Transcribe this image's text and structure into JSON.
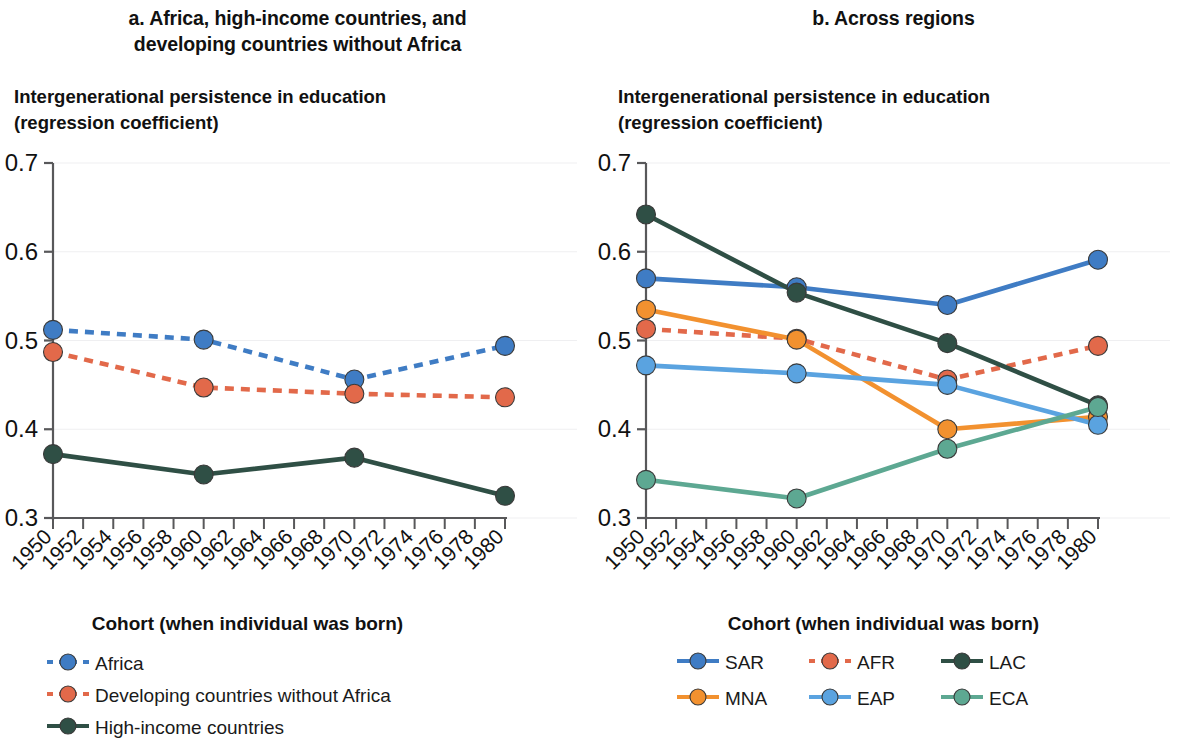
{
  "figure": {
    "panels": [
      {
        "id": "a",
        "title": "a. Africa, high-income countries, and developing countries without Africa",
        "y_axis_title": "Intergenerational persistence in education\n(regression coefficient)",
        "x_axis_title": "Cohort (when individual was born)"
      },
      {
        "id": "b",
        "title": "b. Across regions",
        "y_axis_title": "Intergenerational persistence in education\n(regression coefficient)",
        "x_axis_title": "Cohort (when individual was born)"
      }
    ]
  },
  "colors": {
    "blue": "#3f7cc4",
    "salmon": "#e2694a",
    "dark_green": "#2f4f45",
    "orange": "#f2912f",
    "light_blue": "#5aa3e0",
    "sea_green": "#5da892",
    "axis": "#58585a",
    "grid": "#efeff1",
    "text": "#111111"
  },
  "chart_data": [
    {
      "type": "line",
      "panel": "a",
      "title": "a. Africa, high-income countries, and developing countries without Africa",
      "xlabel": "Cohort (when individual was born)",
      "ylabel": "Intergenerational persistence in education (regression coefficient)",
      "xlim": [
        1950,
        1980
      ],
      "ylim": [
        0.3,
        0.7
      ],
      "yticks": [
        "0.3",
        "0.4",
        "0.5",
        "0.6",
        "0.7"
      ],
      "xticks": [
        "1950",
        "1952",
        "1954",
        "1956",
        "1958",
        "1960",
        "1962",
        "1964",
        "1966",
        "1968",
        "1970",
        "1972",
        "1974",
        "1976",
        "1978",
        "1980"
      ],
      "grid": true,
      "legend_position": "below",
      "x": [
        1950,
        1960,
        1970,
        1980
      ],
      "series": [
        {
          "name": "Africa",
          "color": "#3f7cc4",
          "style": "dashed",
          "values": [
            0.512,
            0.501,
            0.456,
            0.494
          ]
        },
        {
          "name": "Developing countries without Africa",
          "color": "#e2694a",
          "style": "dashed",
          "values": [
            0.487,
            0.447,
            0.44,
            0.436
          ]
        },
        {
          "name": "High-income countries",
          "color": "#2f4f45",
          "style": "solid",
          "values": [
            0.372,
            0.349,
            0.368,
            0.325
          ]
        }
      ]
    },
    {
      "type": "line",
      "panel": "b",
      "title": "b. Across regions",
      "xlabel": "Cohort (when individual was born)",
      "ylabel": "Intergenerational persistence in education (regression coefficient)",
      "xlim": [
        1950,
        1980
      ],
      "ylim": [
        0.3,
        0.7
      ],
      "yticks": [
        "0.3",
        "0.4",
        "0.5",
        "0.6",
        "0.7"
      ],
      "xticks": [
        "1950",
        "1952",
        "1954",
        "1956",
        "1958",
        "1960",
        "1962",
        "1964",
        "1966",
        "1968",
        "1970",
        "1972",
        "1974",
        "1976",
        "1978",
        "1980"
      ],
      "grid": true,
      "legend_position": "below",
      "x": [
        1950,
        1960,
        1970,
        1980
      ],
      "series": [
        {
          "name": "SAR",
          "color": "#3f7cc4",
          "style": "solid",
          "values": [
            0.57,
            0.56,
            0.54,
            0.591
          ]
        },
        {
          "name": "AFR",
          "color": "#e2694a",
          "style": "dashed",
          "values": [
            0.513,
            0.502,
            0.456,
            0.494
          ]
        },
        {
          "name": "LAC",
          "color": "#2f4f45",
          "style": "solid",
          "values": [
            0.642,
            0.554,
            0.497,
            0.427
          ]
        },
        {
          "name": "MNA",
          "color": "#f2912f",
          "style": "solid",
          "values": [
            0.535,
            0.501,
            0.4,
            0.414
          ]
        },
        {
          "name": "EAP",
          "color": "#5aa3e0",
          "style": "solid",
          "values": [
            0.472,
            0.463,
            0.45,
            0.405
          ]
        },
        {
          "name": "ECA",
          "color": "#5da892",
          "style": "solid",
          "values": [
            0.343,
            0.322,
            0.378,
            0.425
          ]
        }
      ]
    }
  ],
  "legends": {
    "a": [
      {
        "label": "Africa",
        "color": "#3f7cc4",
        "style": "dashed"
      },
      {
        "label": "Developing countries without Africa",
        "color": "#e2694a",
        "style": "dashed"
      },
      {
        "label": "High-income countries",
        "color": "#2f4f45",
        "style": "solid"
      }
    ],
    "b": [
      {
        "label": "SAR",
        "color": "#3f7cc4",
        "style": "solid"
      },
      {
        "label": "AFR",
        "color": "#e2694a",
        "style": "dashed"
      },
      {
        "label": "LAC",
        "color": "#2f4f45",
        "style": "solid"
      },
      {
        "label": "MNA",
        "color": "#f2912f",
        "style": "solid"
      },
      {
        "label": "EAP",
        "color": "#5aa3e0",
        "style": "solid"
      },
      {
        "label": "ECA",
        "color": "#5da892",
        "style": "solid"
      }
    ]
  }
}
